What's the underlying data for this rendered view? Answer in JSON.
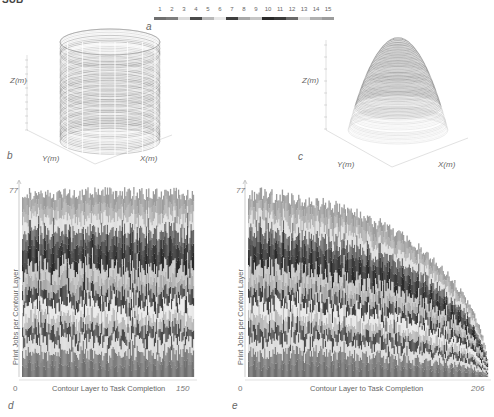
{
  "header_fragment": "SUB",
  "legend": {
    "panel_label": "a",
    "items": [
      {
        "label": "1",
        "color": "#6f6f6f"
      },
      {
        "label": "2",
        "color": "#7d7d7d"
      },
      {
        "label": "3",
        "color": "#dcdcdc"
      },
      {
        "label": "4",
        "color": "#4a4a4a"
      },
      {
        "label": "5",
        "color": "#b8b8b8"
      },
      {
        "label": "6",
        "color": "#e8e8e8"
      },
      {
        "label": "7",
        "color": "#3e3e3e"
      },
      {
        "label": "8",
        "color": "#a8a8a8"
      },
      {
        "label": "9",
        "color": "#c6c6c6"
      },
      {
        "label": "10",
        "color": "#2a2a2a"
      },
      {
        "label": "11",
        "color": "#3a3a3a"
      },
      {
        "label": "12",
        "color": "#6a6a6a"
      },
      {
        "label": "13",
        "color": "#e0e0e0"
      },
      {
        "label": "14",
        "color": "#b0b0b0"
      },
      {
        "label": "15",
        "color": "#9c9c9c"
      }
    ]
  },
  "chart_data": [
    {
      "panel": "b",
      "type": "scatter",
      "title": "",
      "shape": "cylinder",
      "xlabel": "X(m)",
      "ylabel": "Y(m)",
      "zlabel": "Z(m)"
    },
    {
      "panel": "c",
      "type": "scatter",
      "title": "",
      "shape": "dome",
      "xlabel": "X(m)",
      "ylabel": "Y(m)",
      "zlabel": "Z(m)"
    },
    {
      "panel": "d",
      "type": "bar",
      "stacked": true,
      "xlabel": "Contour Layer to Task Completion",
      "ylabel": "Print Jobs per Contour Layer",
      "x_ticks": [
        "0",
        "150"
      ],
      "y_ticks": [
        "77"
      ],
      "xlim": [
        0,
        150
      ],
      "ylim": [
        0,
        77
      ],
      "num_layers": 150,
      "profile": "flat",
      "series_count": 15
    },
    {
      "panel": "e",
      "type": "bar",
      "stacked": true,
      "xlabel": "Contour Layer to Task Completion",
      "ylabel": "Print Jobs per Contour Layer",
      "x_ticks": [
        "0",
        "206"
      ],
      "y_ticks": [
        "77"
      ],
      "xlim": [
        0,
        206
      ],
      "ylim": [
        0,
        77
      ],
      "num_layers": 206,
      "profile": "decreasing-quarter-circle",
      "series_count": 15
    }
  ]
}
